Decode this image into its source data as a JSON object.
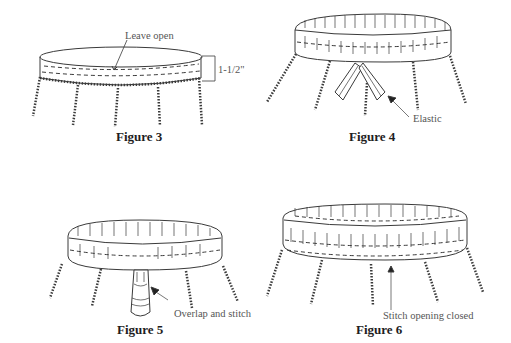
{
  "figures": [
    {
      "id": "figure-3",
      "caption": "Figure 3",
      "annotations": [
        {
          "text": "Leave open"
        },
        {
          "text": "1-1/2\""
        }
      ]
    },
    {
      "id": "figure-4",
      "caption": "Figure 4",
      "annotations": [
        {
          "text": "Elastic"
        }
      ]
    },
    {
      "id": "figure-5",
      "caption": "Figure 5",
      "annotations": [
        {
          "text": "Overlap and stitch"
        }
      ]
    },
    {
      "id": "figure-6",
      "caption": "Figure 6",
      "annotations": [
        {
          "text": "Stitch opening closed"
        }
      ]
    }
  ],
  "colors": {
    "line": "#3a3a3a",
    "background": "#ffffff"
  }
}
